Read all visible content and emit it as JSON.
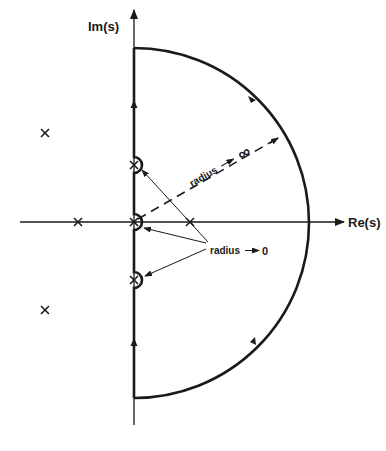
{
  "diagram": {
    "type": "nyquist-contour",
    "axes": {
      "imag_label": "Im(s)",
      "real_label": "Re(s)"
    },
    "annotations": {
      "large_radius": "radius → ∞",
      "large_radius_text": "radius",
      "large_radius_limit": "∞",
      "small_radius_text": "radius",
      "small_radius_limit": "0"
    },
    "poles": [
      {
        "name": "pole-upper-left",
        "x": 45,
        "y": 133
      },
      {
        "name": "pole-real-left",
        "x": 78,
        "y": 222
      },
      {
        "name": "pole-imag-upper",
        "x": 134,
        "y": 165
      },
      {
        "name": "pole-origin",
        "x": 134,
        "y": 222
      },
      {
        "name": "pole-imag-lower",
        "x": 134,
        "y": 280
      },
      {
        "name": "pole-real-right",
        "x": 190,
        "y": 222
      },
      {
        "name": "pole-lower-left",
        "x": 45,
        "y": 310
      }
    ],
    "colors": {
      "ink": "#1a1a1a",
      "background": "#ffffff"
    }
  }
}
